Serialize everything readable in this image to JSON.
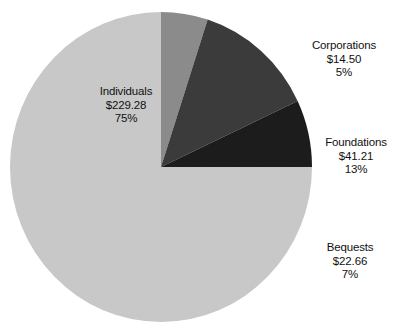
{
  "chart_data": {
    "type": "pie",
    "title": "",
    "subtitle": "",
    "xlabel": "",
    "ylabel": "",
    "legend_position": "none",
    "grid": false,
    "units": "billions of dollars",
    "start_angle_deg": 0,
    "direction": "clockwise",
    "categories": [
      "Individuals",
      "Corporations",
      "Foundations",
      "Bequests"
    ],
    "values": [
      229.28,
      14.5,
      41.21,
      22.66
    ],
    "percents": [
      75,
      13,
      5,
      7
    ],
    "slices": [
      {
        "label": "Individuals",
        "value_text": "$229.28",
        "value": 229.28,
        "percent_text": "75%",
        "percent": 75,
        "color": "#c9c9c9",
        "start_deg": 25,
        "end_deg": 360
      },
      {
        "label": "Corporations",
        "value_text": "$14.50",
        "value": 14.5,
        "percent_text": "5%",
        "percent": 5,
        "color": "#8c8c8c",
        "start_deg": 0,
        "end_deg": 18
      },
      {
        "label": "Foundations",
        "value_text": "$41.21",
        "value": 41.21,
        "percent_text": "13%",
        "percent": 13,
        "color": "#3a3a3a",
        "start_deg": 18,
        "end_deg": 65
      },
      {
        "label": "Bequests",
        "value_text": "$22.66",
        "value": 22.66,
        "percent_text": "7%",
        "percent": 7,
        "color": "#1a1a1a",
        "start_deg": 65,
        "end_deg": 90
      }
    ],
    "background_color": "#ffffff",
    "text_color": "#111111"
  },
  "labels": {
    "individuals": {
      "name": "Individuals",
      "value": "$229.28",
      "percent": "75%"
    },
    "corporations": {
      "name": "Corporations",
      "value": "$14.50",
      "percent": "5%"
    },
    "foundations": {
      "name": "Foundations",
      "value": "$41.21",
      "percent": "13%"
    },
    "bequests": {
      "name": "Bequests",
      "value": "$22.66",
      "percent": "7%"
    }
  }
}
